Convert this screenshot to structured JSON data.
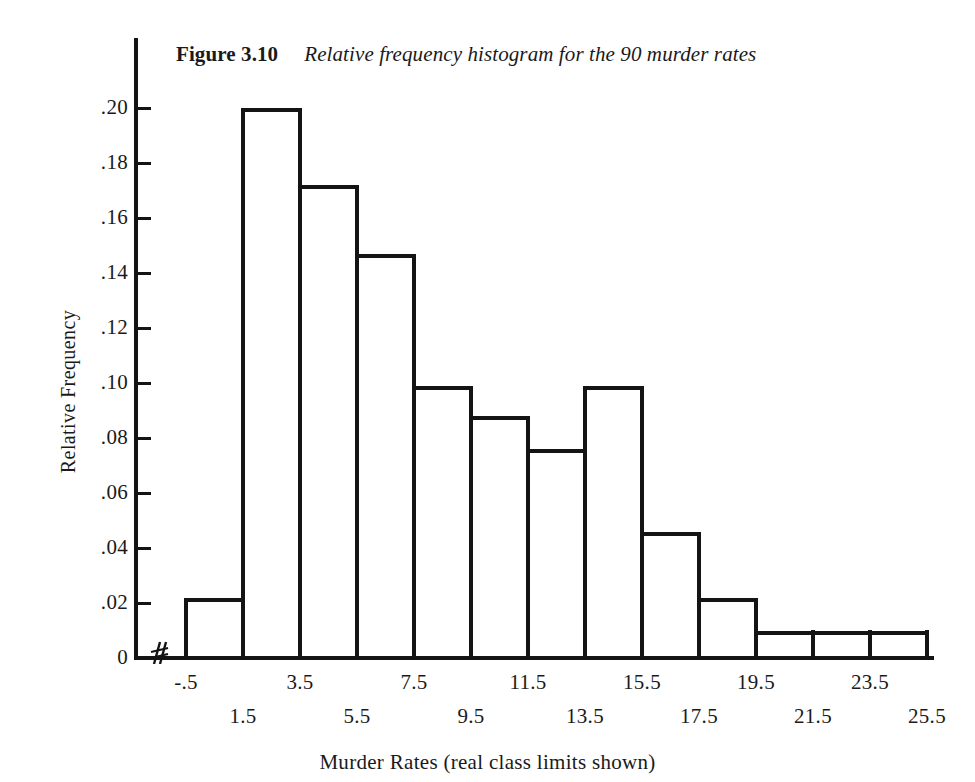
{
  "figure": {
    "label": "Figure 3.10",
    "caption": "Relative frequency histogram for the 90 murder rates"
  },
  "axes": {
    "y_title": "Relative Frequency",
    "x_title": "Murder Rates (real class limits shown)",
    "y_ticks": [
      "0",
      ".02",
      ".04",
      ".06",
      ".08",
      ".10",
      ".12",
      ".14",
      ".16",
      ".18",
      ".20"
    ],
    "x_ticks": [
      "-.5",
      "1.5",
      "3.5",
      "5.5",
      "7.5",
      "9.5",
      "11.5",
      "13.5",
      "15.5",
      "17.5",
      "19.5",
      "21.5",
      "23.5",
      "25.5"
    ]
  },
  "style": {
    "ink_color": "#141414",
    "paper_color": "#ffffff",
    "bar_fill": "transparent"
  },
  "chart_data": {
    "type": "bar",
    "xlabel": "Murder Rates (real class limits shown)",
    "ylabel": "Relative Frequency",
    "grid": false,
    "legend": "none",
    "xlim": [
      -0.5,
      25.5
    ],
    "ylim": [
      0,
      0.21
    ],
    "ytick_values": [
      0,
      0.02,
      0.04,
      0.06,
      0.08,
      0.1,
      0.12,
      0.14,
      0.16,
      0.18,
      0.2
    ],
    "ytick_labels": [
      "0",
      ".02",
      ".04",
      ".06",
      ".08",
      ".10",
      ".12",
      ".14",
      ".16",
      ".18",
      ".20"
    ],
    "xtick_values": [
      -0.5,
      1.5,
      3.5,
      5.5,
      7.5,
      9.5,
      11.5,
      13.5,
      15.5,
      17.5,
      19.5,
      21.5,
      23.5,
      25.5
    ],
    "xtick_labels": [
      "-.5",
      "1.5",
      "3.5",
      "5.5",
      "7.5",
      "9.5",
      "11.5",
      "13.5",
      "15.5",
      "17.5",
      "19.5",
      "21.5",
      "23.5",
      "25.5"
    ],
    "bin_edges": [
      -0.5,
      1.5,
      3.5,
      5.5,
      7.5,
      9.5,
      11.5,
      13.5,
      15.5,
      17.5,
      19.5,
      21.5,
      23.5,
      25.5
    ],
    "categories": [
      "-.5 to 1.5",
      "1.5 to 3.5",
      "3.5 to 5.5",
      "5.5 to 7.5",
      "7.5 to 9.5",
      "9.5 to 11.5",
      "11.5 to 13.5",
      "13.5 to 15.5",
      "15.5 to 17.5",
      "17.5 to 19.5",
      "19.5 to 21.5",
      "21.5 to 23.5",
      "23.5 to 25.5"
    ],
    "values": [
      0.022,
      0.2,
      0.172,
      0.147,
      0.099,
      0.088,
      0.076,
      0.099,
      0.046,
      0.022,
      0.01,
      0.01,
      0.01
    ],
    "n": 90,
    "axis_break_on_x": true
  }
}
